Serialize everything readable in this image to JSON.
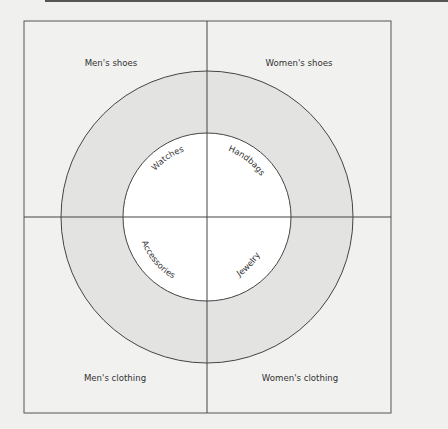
{
  "diagram": {
    "type": "quadrant-concentric",
    "colors": {
      "background": "#f0f0ef",
      "frame": "#555555",
      "ring_fill": "#e3e3e2",
      "inner_fill": "#ffffff",
      "text": "#333333"
    },
    "outer_quadrants": {
      "top_left": "Men's shoes",
      "top_right": "Women's shoes",
      "bottom_left": "Men's clothing",
      "bottom_right": "Women's clothing"
    },
    "inner_quadrants": {
      "top_left": "Watches",
      "top_right": "Handbags",
      "bottom_left": "Accessories",
      "bottom_right": "Jewelry"
    }
  }
}
